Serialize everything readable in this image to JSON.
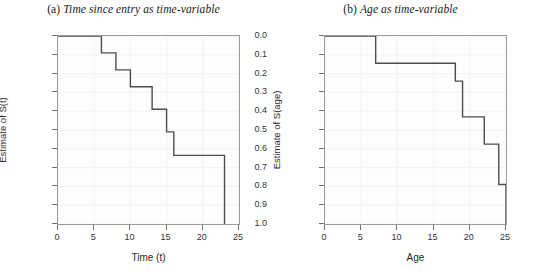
{
  "figure": {
    "background": "#ffffff",
    "line_color": "#4d4d4d",
    "frame_color": "#9a9a9a"
  },
  "panels": [
    {
      "id": "panel-a",
      "tag": "(a)",
      "title": "Time since entry as time-variable",
      "xlabel": "Time (t)",
      "ylabel": "Estimate of S(t)",
      "xticks": [
        "0",
        "5",
        "10",
        "15",
        "20",
        "25"
      ],
      "yticks": [
        "1.0",
        "0.9",
        "0.8",
        "0.7",
        "0.6",
        "0.5",
        "0.4",
        "0.3",
        "0.2",
        "0.1",
        "0.0"
      ]
    },
    {
      "id": "panel-b",
      "tag": "(b)",
      "title": "Age as time-variable",
      "xlabel": "Age",
      "ylabel": "Estimate of S(age)",
      "xticks": [
        "0",
        "5",
        "10",
        "15",
        "20",
        "25"
      ],
      "yticks": [
        "1.0",
        "0.9",
        "0.8",
        "0.7",
        "0.6",
        "0.5",
        "0.4",
        "0.3",
        "0.2",
        "0.1",
        "0.0"
      ]
    }
  ],
  "chart_data": [
    {
      "type": "line",
      "subtype": "kaplan-meier-step",
      "title": "(a) Time since entry as time-variable",
      "xlabel": "Time (t)",
      "ylabel": "Estimate of S(t)",
      "xlim": [
        0,
        25
      ],
      "ylim": [
        0.0,
        1.0
      ],
      "xticks": [
        0,
        5,
        10,
        15,
        20,
        25
      ],
      "yticks": [
        0.0,
        0.1,
        0.2,
        0.3,
        0.4,
        0.5,
        0.6,
        0.7,
        0.8,
        0.9,
        1.0
      ],
      "grid": true,
      "legend": "none",
      "x": [
        0,
        6,
        6,
        8,
        8,
        10,
        10,
        13,
        13,
        15,
        15,
        16,
        16,
        23,
        23
      ],
      "y": [
        1.0,
        1.0,
        0.91,
        0.91,
        0.82,
        0.82,
        0.73,
        0.73,
        0.61,
        0.61,
        0.49,
        0.49,
        0.365,
        0.365,
        0.0
      ],
      "steps": [
        {
          "time": 0,
          "survival": 1.0
        },
        {
          "time": 6,
          "survival": 0.91
        },
        {
          "time": 8,
          "survival": 0.82
        },
        {
          "time": 10,
          "survival": 0.73
        },
        {
          "time": 13,
          "survival": 0.61
        },
        {
          "time": 15,
          "survival": 0.49
        },
        {
          "time": 16,
          "survival": 0.365
        },
        {
          "time": 23,
          "survival": 0.0
        }
      ]
    },
    {
      "type": "line",
      "subtype": "kaplan-meier-step",
      "title": "(b) Age as time-variable",
      "xlabel": "Age",
      "ylabel": "Estimate of S(age)",
      "xlim": [
        0,
        25
      ],
      "ylim": [
        0.0,
        1.0
      ],
      "xticks": [
        0,
        5,
        10,
        15,
        20,
        25
      ],
      "yticks": [
        0.0,
        0.1,
        0.2,
        0.3,
        0.4,
        0.5,
        0.6,
        0.7,
        0.8,
        0.9,
        1.0
      ],
      "grid": true,
      "legend": "none",
      "x": [
        0,
        7,
        7,
        18,
        18,
        19,
        19,
        22,
        22,
        24,
        24,
        25,
        25
      ],
      "y": [
        1.0,
        1.0,
        0.855,
        0.855,
        0.76,
        0.76,
        0.57,
        0.57,
        0.425,
        0.425,
        0.21,
        0.21,
        0.0
      ],
      "steps": [
        {
          "age": 0,
          "survival": 1.0
        },
        {
          "age": 7,
          "survival": 0.855
        },
        {
          "age": 18,
          "survival": 0.76
        },
        {
          "age": 19,
          "survival": 0.57
        },
        {
          "age": 22,
          "survival": 0.425
        },
        {
          "age": 24,
          "survival": 0.21
        },
        {
          "age": 25,
          "survival": 0.0
        }
      ]
    }
  ]
}
